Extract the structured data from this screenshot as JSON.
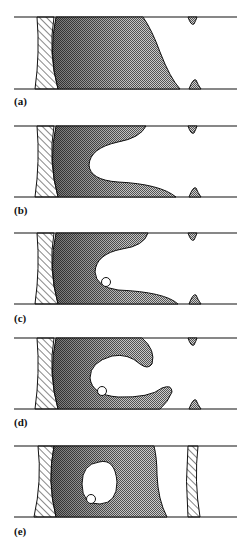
{
  "figure": {
    "panels": [
      {
        "id": "a",
        "label": "(a)",
        "top": 17,
        "bottom": 89,
        "label_y": 95
      },
      {
        "id": "b",
        "label": "(b)",
        "top": 126,
        "bottom": 197,
        "label_y": 204
      },
      {
        "id": "c",
        "label": "(c)",
        "top": 233,
        "bottom": 304,
        "label_y": 312
      },
      {
        "id": "d",
        "label": "(d)",
        "top": 338,
        "bottom": 409,
        "label_y": 416
      },
      {
        "id": "e",
        "label": "(e)",
        "top": 446,
        "bottom": 517,
        "label_y": 525
      }
    ],
    "colors": {
      "line": "#111111",
      "shade": "#8a8a8a",
      "shade_dark": "#555555",
      "background": "#ffffff"
    }
  }
}
